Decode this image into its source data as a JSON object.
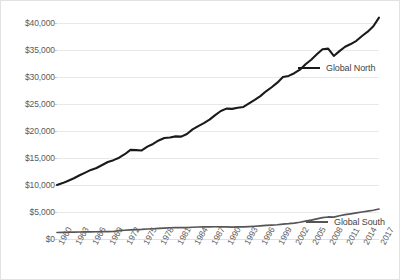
{
  "chart_data": {
    "type": "line",
    "title": "",
    "subtitle": "",
    "xlabel": "",
    "ylabel": "",
    "grid": true,
    "legend_position": "inline-right",
    "ylim": [
      0,
      40000
    ],
    "y_ticks": [
      0,
      5000,
      10000,
      15000,
      20000,
      25000,
      30000,
      35000,
      40000
    ],
    "y_tick_labels": [
      "$0",
      "$5,000",
      "$10,000",
      "$15,000",
      "$20,000",
      "$25,000",
      "$30,000",
      "$35,000",
      "$40,000"
    ],
    "xlim": [
      1960,
      2017
    ],
    "x_tick_labels": [
      "1960",
      "1963",
      "1966",
      "1969",
      "1972",
      "1975",
      "1978",
      "1981",
      "1984",
      "1987",
      "1990",
      "1993",
      "1996",
      "1999",
      "2002",
      "2005",
      "2008",
      "2011",
      "2014",
      "2017"
    ],
    "x": [
      1960,
      1961,
      1962,
      1963,
      1964,
      1965,
      1966,
      1967,
      1968,
      1969,
      1970,
      1971,
      1972,
      1973,
      1974,
      1975,
      1976,
      1977,
      1978,
      1979,
      1980,
      1981,
      1982,
      1983,
      1984,
      1985,
      1986,
      1987,
      1988,
      1989,
      1990,
      1991,
      1992,
      1993,
      1994,
      1995,
      1996,
      1997,
      1998,
      1999,
      2000,
      2001,
      2002,
      2003,
      2004,
      2005,
      2006,
      2007,
      2008,
      2009,
      2010,
      2011,
      2012,
      2013,
      2014,
      2015,
      2016,
      2017
    ],
    "series": [
      {
        "name": "Global North",
        "color": "#1a1a1a",
        "values": [
          10000,
          10350,
          10800,
          11250,
          11800,
          12300,
          12800,
          13150,
          13700,
          14250,
          14600,
          15050,
          15700,
          16500,
          16450,
          16400,
          17100,
          17600,
          18250,
          18700,
          18800,
          19000,
          18950,
          19450,
          20300,
          20900,
          21450,
          22100,
          22950,
          23700,
          24150,
          24100,
          24300,
          24450,
          25100,
          25750,
          26450,
          27350,
          28100,
          28950,
          30000,
          30200,
          30700,
          31350,
          32350,
          33200,
          34200,
          35150,
          35250,
          33900,
          34800,
          35600,
          36100,
          36700,
          37600,
          38400,
          39400,
          41000
        ]
      },
      {
        "name": "Global South",
        "color": "#555555",
        "values": [
          1200,
          1220,
          1250,
          1270,
          1300,
          1320,
          1330,
          1340,
          1370,
          1380,
          1390,
          1560,
          1620,
          1700,
          1740,
          1780,
          1850,
          1900,
          1960,
          2020,
          2080,
          2100,
          2090,
          2120,
          2180,
          2220,
          2250,
          2260,
          2270,
          2260,
          2230,
          2210,
          2230,
          2250,
          2300,
          2360,
          2440,
          2520,
          2570,
          2640,
          2760,
          2840,
          2950,
          3100,
          3300,
          3500,
          3720,
          3960,
          4080,
          4040,
          4300,
          4500,
          4660,
          4830,
          5000,
          5150,
          5320,
          5550
        ]
      }
    ]
  },
  "legend": {
    "north": "Global North",
    "south": "Global South"
  }
}
